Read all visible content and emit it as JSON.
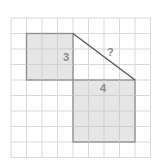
{
  "diagram": {
    "grid_columns": 9,
    "grid_rows": 9,
    "colors": {
      "grid_line": "#d9d9d9",
      "square_fill": "#e6e6e6",
      "square_stroke": "#8c8c8c",
      "hypotenuse": "#555555",
      "label": "#8a8a8a"
    },
    "square_small": {
      "side": 3,
      "label": "3"
    },
    "square_large": {
      "side": 4,
      "label": "4"
    },
    "hypotenuse": {
      "label": "?"
    }
  }
}
